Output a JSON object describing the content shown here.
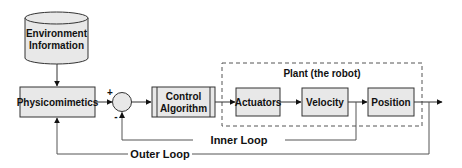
{
  "diagram": {
    "nodes": {
      "environment": {
        "line1": "Environment",
        "line2": "Information",
        "shape": "cylinder"
      },
      "physicomimetics": {
        "label": "Physicomimetics",
        "shape": "rectangle"
      },
      "summing_junction": {
        "plus_sign": "+",
        "minus_sign": "-",
        "shape": "circle"
      },
      "control_algorithm": {
        "line1": "Control",
        "line2": "Algorithm",
        "shape": "predefined-process"
      },
      "actuators": {
        "label": "Actuators",
        "shape": "rectangle"
      },
      "velocity": {
        "label": "Velocity",
        "shape": "rectangle"
      },
      "position": {
        "label": "Position",
        "shape": "rectangle"
      }
    },
    "groups": {
      "plant": {
        "label": "Plant (the robot)",
        "style": "dashed"
      }
    },
    "loops": {
      "inner": {
        "label": "Inner Loop"
      },
      "outer": {
        "label": "Outer Loop"
      }
    },
    "edges": [
      {
        "from": "environment",
        "to": "physicomimetics"
      },
      {
        "from": "physicomimetics",
        "to": "summing_junction",
        "sign": "+"
      },
      {
        "from": "summing_junction",
        "to": "control_algorithm"
      },
      {
        "from": "control_algorithm",
        "to": "actuators"
      },
      {
        "from": "actuators",
        "to": "velocity"
      },
      {
        "from": "velocity",
        "to": "position"
      },
      {
        "from": "position",
        "to": "output"
      },
      {
        "from": "velocity",
        "to": "summing_junction",
        "sign": "-",
        "via": "inner"
      },
      {
        "from": "position",
        "to": "physicomimetics",
        "via": "outer"
      }
    ],
    "colors": {
      "box_fill": "#e8e8e8",
      "stroke": "#333333",
      "line": "#555555",
      "text": "#111111"
    }
  }
}
